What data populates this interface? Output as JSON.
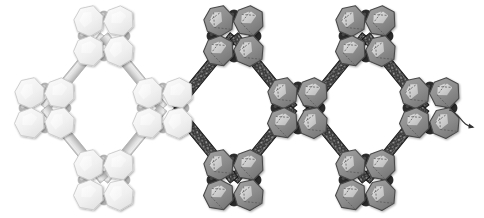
{
  "figure": {
    "title": "Polyhedral chain framework",
    "caption": "Three corner-sharing rhombic units built from four-polyhedron clusters",
    "background_color": "#ffffff",
    "width": 484,
    "height": 218
  },
  "palette": {
    "light_polyhedron_fill": "#f2f2f2",
    "light_polyhedron_edge": "#c9c9c9",
    "light_polyhedron_facet": "#fbfbfb",
    "light_node": "#b4b4b4",
    "light_rod_fill": "#cfcfcf",
    "light_rod_edge": "#b0b0b0",
    "gray_polyhedron_fill": "#8f8f8f",
    "gray_polyhedron_edge": "#4a4a4a",
    "gray_polyhedron_facet": "#d8d8d8",
    "dark_node": "#2b2b2b",
    "dark_rod_fill": "#3a3a3a",
    "dark_rod_edge": "#1c1c1c",
    "rod_speckle": "#d5d5d5",
    "arrow_stroke": "#333333",
    "dash_line": "#5a5a5a"
  },
  "units": [
    {
      "id": "unit-left",
      "style": "light",
      "center": {
        "x": 104,
        "y": 108
      },
      "half_width": 59,
      "half_height": 72
    },
    {
      "id": "unit-middle",
      "style": "dark",
      "center": {
        "x": 234,
        "y": 108
      },
      "half_width": 59,
      "half_height": 72
    },
    {
      "id": "unit-right",
      "style": "dark",
      "center": {
        "x": 366,
        "y": 108
      },
      "half_width": 59,
      "half_height": 72
    }
  ],
  "clusters": [
    {
      "id": "cluster-1",
      "style": "light",
      "x": 45,
      "y": 108,
      "label": "left terminal cluster"
    },
    {
      "id": "cluster-2",
      "style": "light",
      "x": 104,
      "y": 36,
      "label": "left top cluster"
    },
    {
      "id": "cluster-3",
      "style": "light",
      "x": 104,
      "y": 180,
      "label": "left bottom cluster"
    },
    {
      "id": "cluster-4",
      "style": "light",
      "x": 163,
      "y": 108,
      "label": "left-middle bridging cluster"
    },
    {
      "id": "cluster-5",
      "style": "dark",
      "x": 234,
      "y": 36,
      "label": "middle top cluster"
    },
    {
      "id": "cluster-6",
      "style": "dark",
      "x": 234,
      "y": 180,
      "label": "middle bottom cluster"
    },
    {
      "id": "cluster-7",
      "style": "dark",
      "x": 298,
      "y": 108,
      "label": "middle-right bridging cluster"
    },
    {
      "id": "cluster-8",
      "style": "dark",
      "x": 366,
      "y": 36,
      "label": "right top cluster"
    },
    {
      "id": "cluster-9",
      "style": "dark",
      "x": 366,
      "y": 180,
      "label": "right bottom cluster"
    },
    {
      "id": "cluster-10",
      "style": "dark",
      "x": 430,
      "y": 108,
      "label": "right terminal cluster"
    }
  ],
  "annotations": {
    "tail": {
      "name": "curved-tail-arrow",
      "from": {
        "x": 449,
        "y": 110
      },
      "to": {
        "x": 473,
        "y": 127
      },
      "description": "curved arrow tail extending from the right terminal cluster"
    }
  },
  "geometry": {
    "cluster_offset": 15,
    "polyhedron_radius": 15,
    "node_radius_light": 5,
    "node_radius_dark": 6,
    "rod_half_width": 5
  }
}
